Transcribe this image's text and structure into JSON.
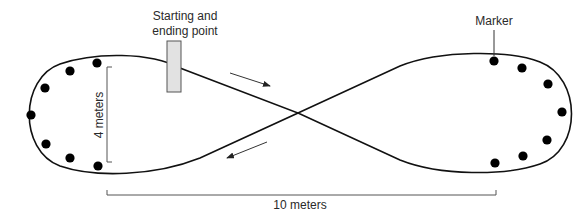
{
  "diagram": {
    "labels": {
      "start_line1": "Starting and",
      "start_line2": "ending point",
      "marker": "Marker",
      "height_dim": "4 meters",
      "width_dim": "10 meters"
    },
    "markers": {
      "left_loop_count": 7,
      "right_loop_count": 7
    },
    "colors": {
      "line": "#111111",
      "marker": "#000000",
      "start_box_fill": "#e2e2e2",
      "start_box_stroke": "#555555",
      "dimension": "#555555",
      "text": "#2a2a2a"
    }
  }
}
